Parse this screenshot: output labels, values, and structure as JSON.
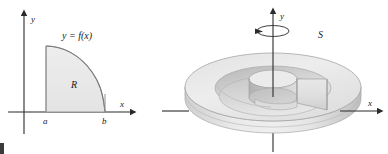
{
  "figure": {
    "kind": "math-illustration",
    "panels": [
      {
        "id": "region-panel",
        "name": "plane-region-R",
        "labels": {
          "y_axis": "y",
          "x_axis": "x",
          "curve": "y = f(x)",
          "region": "R",
          "left_bound": "a",
          "right_bound": "b"
        }
      },
      {
        "id": "solid-panel",
        "name": "solid-of-revolution-S",
        "labels": {
          "y_axis": "y",
          "x_axis": "x",
          "solid": "S"
        }
      }
    ]
  },
  "colors": {
    "ink": "#1a1a1a",
    "axis": "#2b2b2b",
    "region_fill": "#e9e9e9",
    "region_stroke": "#8a8a8a",
    "solid_light": "#f2f2f2",
    "solid_mid": "#d8d8d8",
    "solid_dark": "#b4b4b4",
    "solid_shadow": "#9e9e9e",
    "solid_stroke": "#a0a0a0",
    "background": "#ffffff"
  }
}
